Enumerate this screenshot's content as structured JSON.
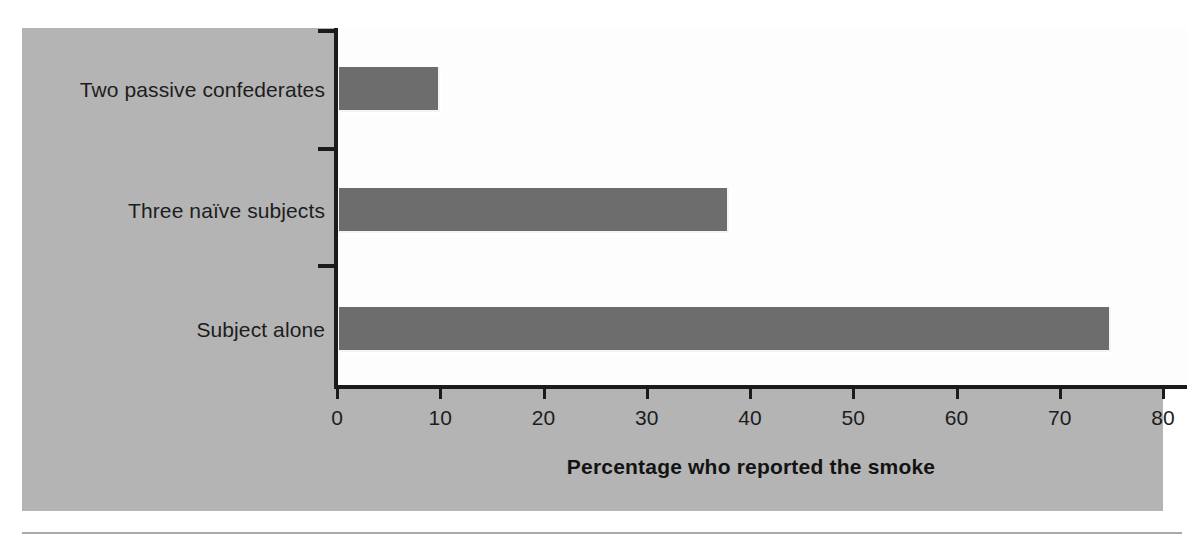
{
  "chart_data": {
    "type": "bar",
    "orientation": "horizontal",
    "title": "",
    "xlabel": "Percentage who reported the smoke",
    "ylabel": "",
    "categories": [
      "Two passive confederates",
      "Three naïve subjects",
      "Subject alone"
    ],
    "values": [
      10,
      38,
      75
    ],
    "xlim": [
      0,
      80
    ],
    "xticks": [
      0,
      10,
      20,
      30,
      40,
      50,
      60,
      70,
      80
    ],
    "xtick_labels": [
      "0",
      "10",
      "20",
      "30",
      "40",
      "50",
      "60",
      "70",
      "80"
    ],
    "grid": false,
    "legend": null,
    "series": [
      {
        "name": "Percentage who reported the smoke",
        "values": [
          10,
          38,
          75
        ],
        "color": "#6d6d6d"
      }
    ]
  },
  "colors": {
    "panel_background": "#b4b4b4",
    "plot_background": "#fdfdfd",
    "bar_fill": "#6d6d6d",
    "bar_highlight": "#f4f4f4",
    "axis_line": "#1b1b1b",
    "text": "#1d1d1d",
    "rule": "#a9a9a9"
  }
}
